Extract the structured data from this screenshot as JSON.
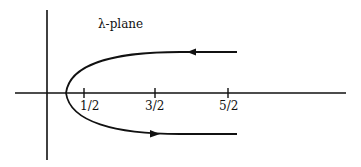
{
  "title": "λ-plane",
  "axes": {
    "tick_labels": [
      "1/2",
      "3/2",
      "5/2"
    ]
  },
  "curve": {
    "description": "Parabola-like contour opening to the right, vertex left of 1/2 on the real axis; upper branch directed leftward, lower branch directed rightward",
    "upper_arrow": "left",
    "lower_arrow": "right"
  },
  "colors": {
    "stroke": "#111111",
    "background": "#ffffff"
  }
}
